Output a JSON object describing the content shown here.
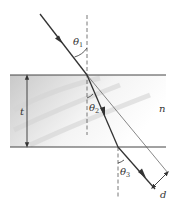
{
  "figure": {
    "labels": {
      "theta1": "θ",
      "theta1_sub": "1",
      "theta2": "θ",
      "theta2_sub": "2",
      "theta3": "θ",
      "theta3_sub": "3",
      "thickness": "t",
      "index": "n",
      "displacement": "d"
    },
    "colors": {
      "ray": "#333333",
      "normal": "#555555",
      "slab_shade": "#d8d8d8",
      "boundary": "#444444"
    }
  }
}
